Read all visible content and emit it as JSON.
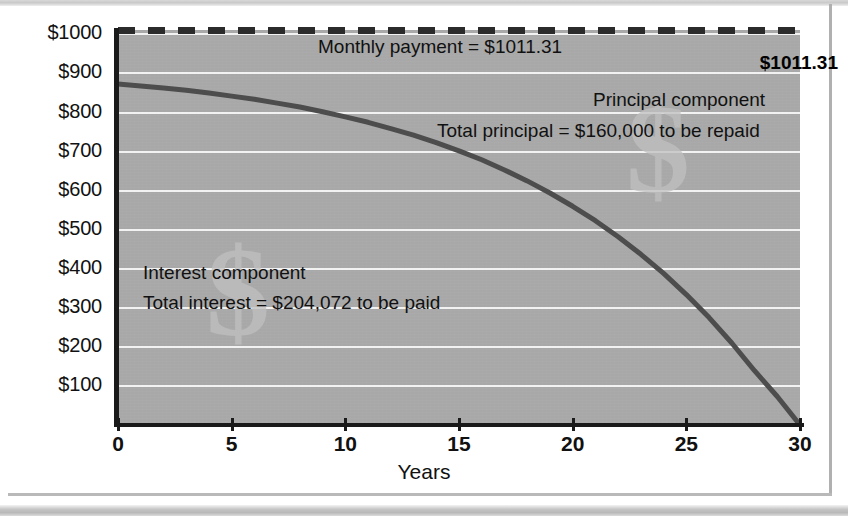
{
  "figure": {
    "background_color": "#ffffff",
    "plot_background_color": "#a8a8a8",
    "gridline_color": "#f2f2f2",
    "curve_color": "#4d4d4d",
    "dash_color": "#2b2b2b",
    "watermark_glyph": "$"
  },
  "axes": {
    "x_title": "Years",
    "y_top_label": "$1011.31"
  },
  "annotations": {
    "monthly_payment": "Monthly payment = $1011.31",
    "principal_component": "Principal component",
    "total_principal": "Total principal = $160,000 to be repaid",
    "interest_component": "Interest component",
    "total_interest": "Total interest = $204,072 to be paid"
  },
  "chart_data": {
    "type": "line",
    "title": "",
    "subtitle": "",
    "xlabel": "Years",
    "ylabel": "",
    "xlim": [
      0,
      30
    ],
    "ylim": [
      0,
      1011.31
    ],
    "grid": true,
    "legend_position": "none",
    "xticks": [
      0,
      5,
      10,
      15,
      20,
      25,
      30
    ],
    "xticklabels": [
      "0",
      "5",
      "10",
      "15",
      "20",
      "25",
      "30"
    ],
    "yticks": [
      100,
      200,
      300,
      400,
      500,
      600,
      700,
      800,
      900,
      1000,
      1011.31
    ],
    "yticklabels": [
      "$100",
      "$200",
      "$300",
      "$400",
      "$500",
      "$600",
      "$700",
      "$800",
      "$900",
      "$1000",
      "$1011.31"
    ],
    "annotations": [
      "Monthly payment = $1011.31",
      "Principal component",
      "Total principal = $160,000 to be repaid",
      "Interest component",
      "Total interest = $204,072 to be paid"
    ],
    "series": [
      {
        "name": "Monthly payment",
        "style": "dashed",
        "color": "#2b2b2b",
        "x": [
          0,
          30
        ],
        "values": [
          1011.31,
          1011.31
        ]
      },
      {
        "name": "Interest component",
        "style": "solid",
        "color": "#4d4d4d",
        "x": [
          0,
          1,
          2,
          3,
          4,
          5,
          6,
          7,
          8,
          9,
          10,
          11,
          12,
          13,
          14,
          15,
          16,
          17,
          18,
          19,
          20,
          21,
          22,
          23,
          24,
          25,
          26,
          27,
          28,
          29,
          30
        ],
        "values": [
          873,
          868,
          863,
          857,
          850,
          842,
          834,
          824,
          814,
          802,
          789,
          775,
          759,
          742,
          723,
          702,
          679,
          653,
          625,
          594,
          560,
          523,
          482,
          437,
          388,
          334,
          275,
          210,
          139,
          73,
          0
        ]
      }
    ]
  }
}
